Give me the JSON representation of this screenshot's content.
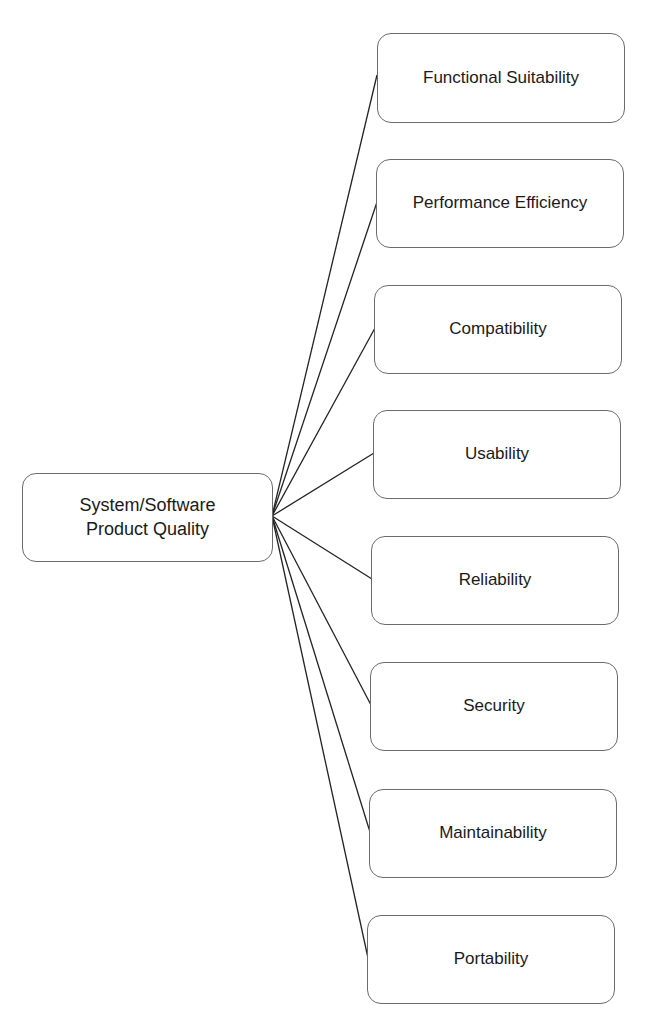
{
  "diagram": {
    "type": "tree",
    "root": {
      "label_line1": "System/Software",
      "label_line2": "Product Quality"
    },
    "children": [
      {
        "label": "Functional Suitability"
      },
      {
        "label": "Performance Efficiency"
      },
      {
        "label": "Compatibility"
      },
      {
        "label": "Usability"
      },
      {
        "label": "Reliability"
      },
      {
        "label": "Security"
      },
      {
        "label": "Maintainability"
      },
      {
        "label": "Portability"
      }
    ]
  }
}
